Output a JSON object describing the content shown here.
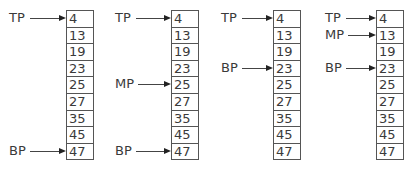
{
  "diagram": {
    "type": "binary-search-trace",
    "panels": [
      {
        "values": [
          "4",
          "13",
          "19",
          "23",
          "25",
          "27",
          "35",
          "45",
          "47"
        ],
        "pointers": [
          {
            "label": "TP",
            "index": 0
          },
          {
            "label": "BP",
            "index": 8
          }
        ]
      },
      {
        "values": [
          "4",
          "13",
          "19",
          "23",
          "25",
          "27",
          "35",
          "45",
          "47"
        ],
        "pointers": [
          {
            "label": "TP",
            "index": 0
          },
          {
            "label": "MP",
            "index": 4
          },
          {
            "label": "BP",
            "index": 8
          }
        ]
      },
      {
        "values": [
          "4",
          "13",
          "19",
          "23",
          "25",
          "27",
          "35",
          "45",
          "47"
        ],
        "pointers": [
          {
            "label": "TP",
            "index": 0
          },
          {
            "label": "BP",
            "index": 3
          }
        ]
      },
      {
        "values": [
          "4",
          "13",
          "19",
          "23",
          "25",
          "27",
          "35",
          "45",
          "47"
        ],
        "pointers": [
          {
            "label": "TP",
            "index": 0
          },
          {
            "label": "MP",
            "index": 1
          },
          {
            "label": "BP",
            "index": 3
          }
        ]
      }
    ]
  },
  "layout": {
    "array_left": [
      66,
      171,
      273,
      376
    ],
    "label_left": [
      9,
      115,
      221,
      325
    ],
    "row_top": 10,
    "row_pitch": 16.6
  }
}
